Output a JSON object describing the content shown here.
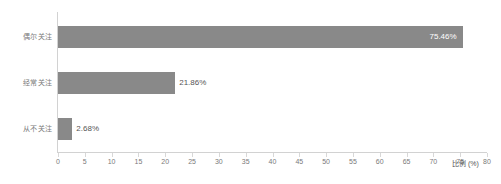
{
  "chart_data": {
    "type": "bar",
    "orientation": "horizontal",
    "title": "",
    "subtitle": "",
    "xlabel": "比例 (%)",
    "ylabel": "",
    "categories": [
      "偶尔关注",
      "经常关注",
      "从不关注"
    ],
    "values": [
      75.46,
      21.86,
      2.68
    ],
    "value_labels": [
      "75.46%",
      "21.86%",
      "2.68%"
    ],
    "xlim": [
      0,
      80
    ],
    "xticks": [
      0,
      5,
      10,
      15,
      20,
      25,
      30,
      35,
      40,
      45,
      50,
      55,
      60,
      65,
      70,
      75,
      80
    ],
    "xtick_labels": [
      "0",
      "5",
      "10",
      "15",
      "20",
      "25",
      "30",
      "35",
      "40",
      "45",
      "50",
      "55",
      "60",
      "65",
      "70",
      "75",
      "80"
    ],
    "grid": false,
    "legend": null,
    "series": [
      {
        "name": "比例",
        "values": [
          75.46,
          21.86,
          2.68
        ]
      }
    ],
    "colors": {
      "bar": "#898989",
      "axis_line": "#d2d2d2",
      "tick_label": "#7a7a7a",
      "category_label": "#7a7a7a",
      "value_label_inside": "#ffffff",
      "value_label_outside": "#555555",
      "background": "#ffffff"
    }
  }
}
